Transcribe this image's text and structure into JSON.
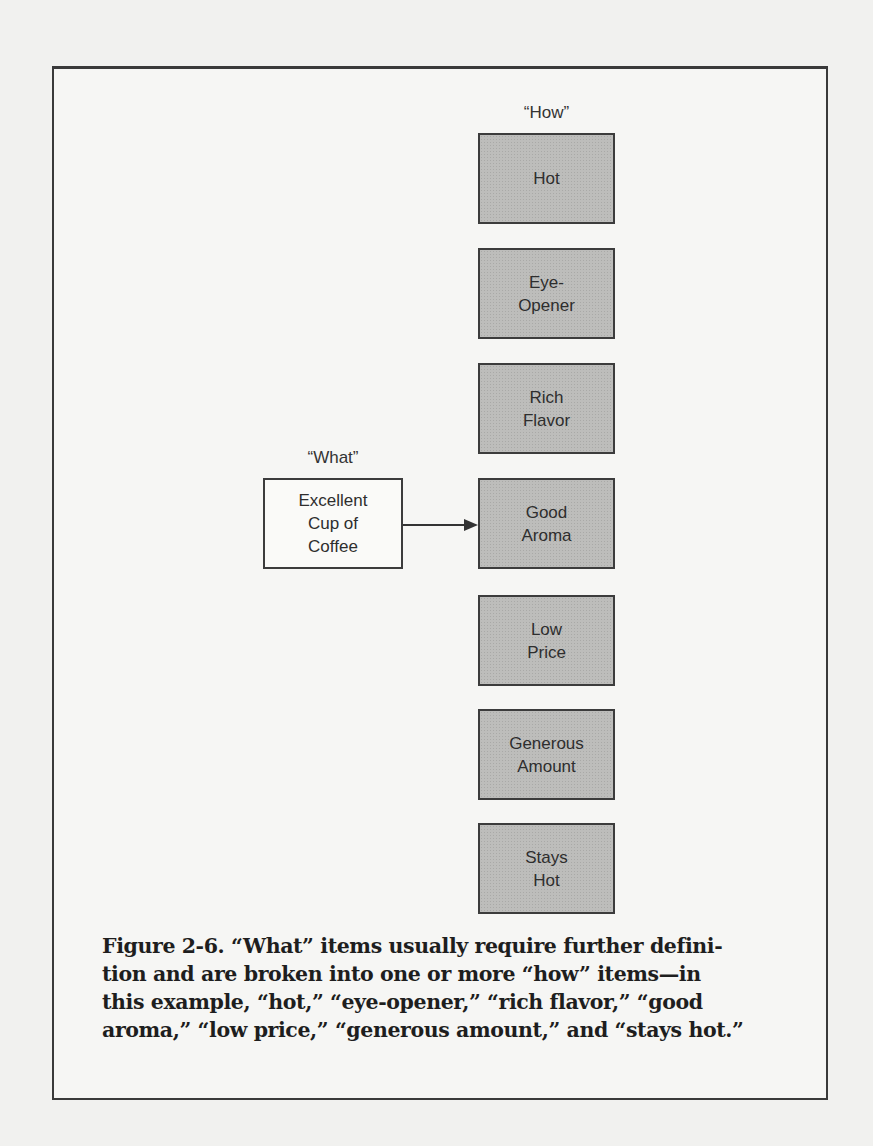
{
  "diagram": {
    "how_label": "“How”",
    "what_label": "“What”",
    "what_item": "Excellent\nCup of\nCoffee",
    "how_items": [
      {
        "text": "Hot",
        "top": 133
      },
      {
        "text": "Eye-\nOpener",
        "top": 248
      },
      {
        "text": "Rich\nFlavor",
        "top": 363
      },
      {
        "text": "Good\nAroma",
        "top": 478
      },
      {
        "text": "Low\nPrice",
        "top": 595
      },
      {
        "text": "Generous\nAmount",
        "top": 709
      },
      {
        "text": "Stays\nHot",
        "top": 823
      }
    ],
    "arrow": {
      "from": "Excellent Cup of Coffee",
      "to": "Good Aroma"
    },
    "colors": {
      "how_box_fill": "#bdbdbb",
      "what_box_fill": "#fafaf8",
      "border": "#3c3c3c"
    }
  },
  "caption": {
    "lines": [
      "Figure 2-6. “What” items usually require further defini-",
      "tion and are broken into one or more “how” items—in",
      "this example, “hot,” “eye-opener,” “rich flavor,” “good",
      "aroma,” “low price,” “generous amount,” and “stays hot.”"
    ]
  }
}
